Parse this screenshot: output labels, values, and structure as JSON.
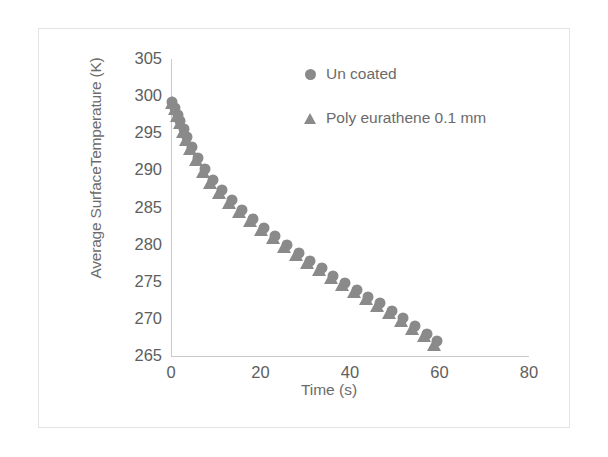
{
  "chart_data": {
    "type": "scatter",
    "title": "",
    "xlabel": "Time (s)",
    "ylabel": "Average SurfaceTemperature (K)",
    "xlim": [
      0,
      80
    ],
    "ylim": [
      265,
      305
    ],
    "xticks": [
      0,
      20,
      40,
      60,
      80
    ],
    "yticks": [
      265,
      270,
      275,
      280,
      285,
      290,
      295,
      300,
      305
    ],
    "grid": false,
    "legend_position": "top-right",
    "marker_color": "#8a8a8a",
    "axis_color": "#c9c9c9",
    "text_color": "#6b6b6b",
    "series": [
      {
        "name": "Un coated",
        "marker": "circle",
        "x": [
          0.3,
          0.9,
          1.5,
          2.1,
          2.8,
          3.6,
          4.6,
          6.0,
          7.6,
          9.4,
          11.4,
          13.6,
          15.9,
          18.3,
          20.8,
          23.3,
          25.9,
          28.5,
          31.1,
          33.7,
          36.3,
          38.9,
          41.5,
          44.1,
          46.7,
          49.3,
          51.9,
          54.5,
          57.1,
          59.4
        ],
        "y": [
          299.2,
          298.4,
          297.5,
          296.6,
          295.6,
          294.5,
          293.2,
          291.7,
          290.2,
          288.7,
          287.3,
          286.0,
          284.7,
          283.5,
          282.3,
          281.1,
          280.0,
          278.9,
          277.8,
          276.8,
          275.8,
          274.8,
          273.9,
          273.0,
          272.1,
          271.1,
          270.1,
          269.1,
          268.0,
          267.0
        ]
      },
      {
        "name": "Poly eurathene 0.1 mm",
        "marker": "triangle",
        "x": [
          0.2,
          0.8,
          1.4,
          2.0,
          2.7,
          3.4,
          4.3,
          5.6,
          7.1,
          8.8,
          10.8,
          13.0,
          15.3,
          17.7,
          20.2,
          22.7,
          25.3,
          27.9,
          30.5,
          33.1,
          35.7,
          38.3,
          40.9,
          43.5,
          46.1,
          48.7,
          51.3,
          53.9,
          56.5,
          58.8
        ],
        "y": [
          299.0,
          298.1,
          297.2,
          296.2,
          295.1,
          294.0,
          292.7,
          291.2,
          289.7,
          288.2,
          286.8,
          285.5,
          284.2,
          283.0,
          281.8,
          280.7,
          279.6,
          278.5,
          277.4,
          276.4,
          275.4,
          274.4,
          273.5,
          272.6,
          271.6,
          270.6,
          269.6,
          268.5,
          267.5,
          266.4
        ]
      }
    ]
  },
  "axes": {
    "y_title": "Average SurfaceTemperature (K)",
    "x_title": "Time (s)"
  },
  "legend": {
    "entries": [
      {
        "label": "Un coated",
        "marker": "circle-marker"
      },
      {
        "label": "Poly eurathene 0.1 mm",
        "marker": "triangle-marker"
      }
    ]
  }
}
